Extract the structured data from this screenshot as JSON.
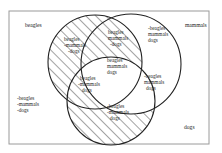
{
  "diagram": {
    "type": "venn-3-set",
    "frame": {
      "x": 9,
      "y": 11,
      "width": 200,
      "height": 133,
      "border_color": "#9a9a9a"
    },
    "sets": [
      {
        "id": "A",
        "name": "beagles",
        "cx": 95,
        "cy": 62,
        "r": 47,
        "label": "beagles",
        "label_x": 25,
        "label_y": 27
      },
      {
        "id": "B",
        "name": "mammals",
        "cx": 131,
        "cy": 64,
        "r": 50,
        "label": "mammals",
        "label_x": 185,
        "label_y": 27
      },
      {
        "id": "C",
        "name": "dogs",
        "cx": 111,
        "cy": 101,
        "r": 44,
        "label": "dogs",
        "label_x": 184,
        "label_y": 129
      }
    ],
    "regions": [
      {
        "id": "A_only",
        "lines": [
          "beagles",
          "-mammals",
          "-dogs"
        ],
        "x": 68,
        "y": 40,
        "hatched": true
      },
      {
        "id": "AB_notC",
        "lines": [
          "-beagles",
          "mammals",
          "dogs"
        ],
        "x": 148,
        "y": 30,
        "hatched": false
      },
      {
        "id": "ABC",
        "lines": [
          "beagles",
          "mammals",
          "dogs"
        ],
        "x": 108,
        "y": 60,
        "hatched": false
      },
      {
        "id": "BC_notA",
        "lines": [
          "-beagles",
          "mammals",
          "dogs"
        ],
        "x": 143,
        "y": 76,
        "hatched": false
      },
      {
        "id": "AC_notB",
        "lines": [
          "beagles",
          "-mammals",
          "dogs"
        ],
        "x": 78,
        "y": 79,
        "hatched": true
      },
      {
        "id": "C_only",
        "lines": [
          "-beagles",
          "-mammals",
          "dogs"
        ],
        "x": 106,
        "y": 106,
        "hatched": true
      },
      {
        "id": "AB_top",
        "lines": [
          "beagles",
          "mammals",
          "-dogs"
        ],
        "x": 106,
        "y": 34,
        "hatched": true
      },
      {
        "id": "outside",
        "lines": [
          "-beagles",
          "-mammals",
          "-dogs"
        ],
        "x": 16,
        "y": 100,
        "hatched": false
      }
    ],
    "hatch_color": "#333333",
    "stroke_color": "#222222"
  }
}
